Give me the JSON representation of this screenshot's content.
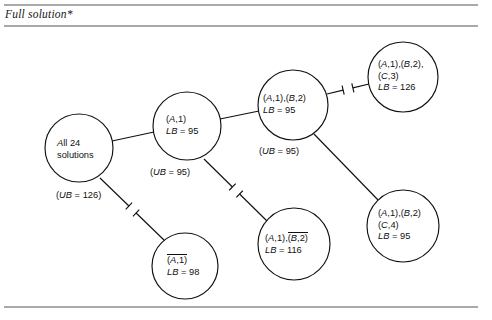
{
  "figure": {
    "title": "Full solution*",
    "kind": "branch-and-bound-tree"
  },
  "nodes": [
    {
      "id": "root",
      "name": "node-all-solutions",
      "cx": 79,
      "cy": 148,
      "r": 34,
      "text_x": 57,
      "text_y": 138,
      "lines": [
        {
          "text": "All 24",
          "style": "plain"
        },
        {
          "text": "solutions",
          "style": "plain"
        }
      ]
    },
    {
      "id": "a1",
      "name": "node-a1",
      "cx": 187,
      "cy": 126,
      "r": 34,
      "text_x": 166,
      "text_y": 114,
      "lines": [
        {
          "text": "(A,1)",
          "style": "italic-tuple"
        },
        {
          "text": "LB = 95",
          "style": "bound"
        }
      ]
    },
    {
      "id": "a1b2",
      "name": "node-a1-b2",
      "cx": 293,
      "cy": 105,
      "r": 35,
      "text_x": 263,
      "text_y": 93,
      "lines": [
        {
          "text": "(A,1),(B,2)",
          "style": "italic-tuple"
        },
        {
          "text": "LB = 95",
          "style": "bound"
        }
      ]
    },
    {
      "id": "a1b2c3",
      "name": "node-a1-b2-c3",
      "cx": 403,
      "cy": 77,
      "r": 35,
      "text_x": 378,
      "text_y": 59,
      "lines": [
        {
          "text": "(A,1),(B,2),",
          "style": "italic-tuple"
        },
        {
          "text": "(C,3)",
          "style": "italic-tuple"
        },
        {
          "text": "LB = 126",
          "style": "bound"
        }
      ]
    },
    {
      "id": "a1b2c4",
      "name": "node-a1-b2-c4",
      "cx": 403,
      "cy": 226,
      "r": 36,
      "text_x": 378,
      "text_y": 208,
      "lines": [
        {
          "text": "(A,1),(B,2)",
          "style": "italic-tuple"
        },
        {
          "text": "(C,4)",
          "style": "italic-tuple"
        },
        {
          "text": "LB = 95",
          "style": "bound"
        }
      ]
    },
    {
      "id": "a1b2bar",
      "name": "node-a1-b2-complement",
      "cx": 294,
      "cy": 244,
      "r": 36,
      "text_x": 265,
      "text_y": 232,
      "lines": [
        {
          "text": "(A,1),",
          "style": "italic-tuple",
          "overline_after": "(B,2)"
        },
        {
          "text": "LB = 116",
          "style": "bound"
        }
      ]
    },
    {
      "id": "a1bar",
      "name": "node-a1-complement",
      "cx": 185,
      "cy": 266,
      "r": 33,
      "text_x": 167,
      "text_y": 254,
      "lines": [
        {
          "text": "",
          "style": "italic-tuple",
          "overline_after": "(A,1)"
        },
        {
          "text": "LB = 98",
          "style": "bound"
        }
      ]
    }
  ],
  "edges": [
    {
      "name": "edge-root-to-a1",
      "x1": 112,
      "y1": 141,
      "x2": 154,
      "y2": 132,
      "pruned": false
    },
    {
      "name": "edge-a1-to-a1b2",
      "x1": 220,
      "y1": 119,
      "x2": 259,
      "y2": 111,
      "pruned": false
    },
    {
      "name": "edge-a1b2-to-a1b2c3",
      "x1": 327,
      "y1": 94,
      "x2": 369,
      "y2": 84,
      "pruned": true
    },
    {
      "name": "edge-a1b2-to-a1b2c4",
      "x1": 314,
      "y1": 134,
      "x2": 379,
      "y2": 201,
      "pruned": false
    },
    {
      "name": "edge-a1-to-a1b2bar",
      "x1": 204,
      "y1": 159,
      "x2": 268,
      "y2": 222,
      "pruned": true
    },
    {
      "name": "edge-root-to-a1bar",
      "x1": 100,
      "y1": 178,
      "x2": 165,
      "y2": 241,
      "pruned": true
    }
  ],
  "bound_labels": [
    {
      "name": "bound-label-root",
      "text": "(UB = 126)",
      "x": 56,
      "y": 190
    },
    {
      "name": "bound-label-a1",
      "text": "(UB = 95)",
      "x": 150,
      "y": 167
    },
    {
      "name": "bound-label-a1b2",
      "text": "(UB = 95)",
      "x": 259,
      "y": 146
    }
  ],
  "rules": [
    {
      "name": "rule-top",
      "x1": 4,
      "y1": 5,
      "x2": 478,
      "y2": 5
    },
    {
      "name": "rule-under-title",
      "x1": 4,
      "y1": 26,
      "x2": 478,
      "y2": 26
    },
    {
      "name": "rule-bottom",
      "x1": 4,
      "y1": 307,
      "x2": 478,
      "y2": 307
    }
  ],
  "colors": {
    "ink": "#111111",
    "rule": "#555555",
    "background": "#ffffff"
  }
}
